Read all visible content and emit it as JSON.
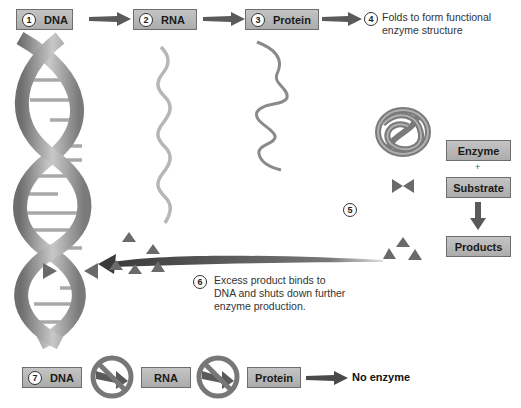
{
  "top_row": {
    "steps": [
      {
        "num": "1",
        "label": "DNA"
      },
      {
        "num": "2",
        "label": "RNA"
      },
      {
        "num": "3",
        "label": "Protein"
      }
    ],
    "step4": {
      "num": "4",
      "line1": "Folds to form functional",
      "line2": "enzyme structure"
    }
  },
  "reaction": {
    "step5_num": "5",
    "enzyme": "Enzyme",
    "plus": "+",
    "substrate": "Substrate",
    "products": "Products"
  },
  "feedback": {
    "num": "6",
    "line1": "Excess product binds to",
    "line2": "DNA and shuts down further",
    "line3": "enzyme production."
  },
  "bottom_row": {
    "num": "7",
    "dna": "DNA",
    "rna": "RNA",
    "protein": "Protein",
    "result": "No enzyme"
  },
  "colors": {
    "box_fill": "#b8b8b8",
    "arrow": "#555555",
    "product_triangle": "#6a6a6a",
    "helix": "#8a8a8a"
  }
}
